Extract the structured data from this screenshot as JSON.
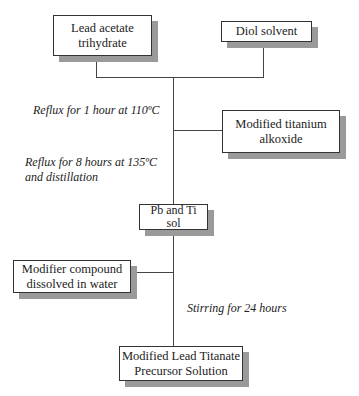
{
  "diagram": {
    "type": "process-flowchart",
    "nodes": [
      {
        "id": "lead_acetate",
        "lines": [
          "Lead acetate",
          "trihydrate"
        ]
      },
      {
        "id": "diol_solvent",
        "lines": [
          "Diol solvent"
        ]
      },
      {
        "id": "titanium_alkoxide",
        "lines": [
          "Modified titanium",
          "alkoxide"
        ]
      },
      {
        "id": "pb_ti_sol",
        "lines": [
          "Pb and Ti",
          "sol"
        ]
      },
      {
        "id": "modifier_compound",
        "lines": [
          "Modifier compound",
          "dissolved in water"
        ]
      },
      {
        "id": "precursor_solution",
        "lines": [
          "Modified Lead Titanate",
          "Precursor Solution"
        ]
      }
    ],
    "steps": [
      {
        "id": "reflux_1",
        "lines": [
          "Reflux for 1 hour at 110ºC"
        ]
      },
      {
        "id": "reflux_8",
        "lines": [
          "Reflux for 8 hours at 135ºC",
          "and distillation"
        ]
      },
      {
        "id": "stirring",
        "lines": [
          "Stirring for 24 hours"
        ]
      }
    ],
    "edges": [
      {
        "from": "lead_acetate",
        "to": "pb_ti_sol"
      },
      {
        "from": "diol_solvent",
        "to": "pb_ti_sol"
      },
      {
        "from": "titanium_alkoxide",
        "to": "pb_ti_sol"
      },
      {
        "from": "pb_ti_sol",
        "to": "precursor_solution"
      },
      {
        "from": "modifier_compound",
        "to": "precursor_solution"
      }
    ]
  }
}
